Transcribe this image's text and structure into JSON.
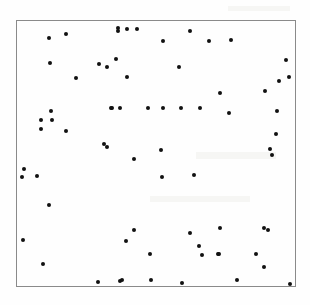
{
  "figure": {
    "title": "",
    "width": 310,
    "height": 305,
    "background_color": "#fefefe",
    "frame": {
      "x": 16,
      "y": 20,
      "width": 280,
      "height": 267,
      "border_color": "#8a8a8a",
      "border_width": 1
    },
    "marker": {
      "color": "#111111",
      "size_px": 4,
      "shape": "circle"
    }
  },
  "chart_data": {
    "type": "scatter",
    "title": "",
    "xlabel": "",
    "ylabel": "",
    "xlim": [
      0,
      1
    ],
    "ylim": [
      0,
      1
    ],
    "grid": false,
    "legend": null,
    "tick_labels": {
      "x": [],
      "y": []
    },
    "n_points": 71,
    "series": [
      {
        "name": "points",
        "color": "#111111",
        "marker": "circle",
        "points_px": [
          [
            47.7,
            37.0
          ],
          [
            65.0,
            33.0
          ],
          [
            117.3,
            26.7
          ],
          [
            117.3,
            29.7
          ],
          [
            126.0,
            28.0
          ],
          [
            136.0,
            28.0
          ],
          [
            188.7,
            29.7
          ],
          [
            208.3,
            40.0
          ],
          [
            230.0,
            39.0
          ],
          [
            162.0,
            40.0
          ],
          [
            49.0,
            61.7
          ],
          [
            98.0,
            63.3
          ],
          [
            105.7,
            66.3
          ],
          [
            114.7,
            58.3
          ],
          [
            177.7,
            65.7
          ],
          [
            285.0,
            58.7
          ],
          [
            75.3,
            77.3
          ],
          [
            126.3,
            76.3
          ],
          [
            288.3,
            76.3
          ],
          [
            277.7,
            80.0
          ],
          [
            264.0,
            90.3
          ],
          [
            218.7,
            92.0
          ],
          [
            110.0,
            107.0
          ],
          [
            110.7,
            107.0
          ],
          [
            119.0,
            107.0
          ],
          [
            146.7,
            107.0
          ],
          [
            162.3,
            107.0
          ],
          [
            180.0,
            107.0
          ],
          [
            199.0,
            107.0
          ],
          [
            227.7,
            111.7
          ],
          [
            49.7,
            110.3
          ],
          [
            39.7,
            118.7
          ],
          [
            50.7,
            119.0
          ],
          [
            40.0,
            128.3
          ],
          [
            65.0,
            130.0
          ],
          [
            275.0,
            133.0
          ],
          [
            102.7,
            142.7
          ],
          [
            106.0,
            145.7
          ],
          [
            133.3,
            157.7
          ],
          [
            160.3,
            149.0
          ],
          [
            271.0,
            154.0
          ],
          [
            160.7,
            176.3
          ],
          [
            192.7,
            174.0
          ],
          [
            23.3,
            168.3
          ],
          [
            21.3,
            176.0
          ],
          [
            36.3,
            175.3
          ],
          [
            47.7,
            204.0
          ],
          [
            22.3,
            239.0
          ],
          [
            41.7,
            263.0
          ],
          [
            97.3,
            281.0
          ],
          [
            119.0,
            280.0
          ],
          [
            132.7,
            229.0
          ],
          [
            125.0,
            239.7
          ],
          [
            149.3,
            253.0
          ],
          [
            188.7,
            232.0
          ],
          [
            198.0,
            244.7
          ],
          [
            201.0,
            254.3
          ],
          [
            217.0,
            252.7
          ],
          [
            218.7,
            227.0
          ],
          [
            263.0,
            227.0
          ],
          [
            218.0,
            253.3
          ],
          [
            255.0,
            253.3
          ],
          [
            263.3,
            266.0
          ],
          [
            235.7,
            279.0
          ],
          [
            289.0,
            282.7
          ],
          [
            121.0,
            279.0
          ],
          [
            149.7,
            278.7
          ],
          [
            180.7,
            282.3
          ],
          [
            267.0,
            229.0
          ],
          [
            269.0,
            148.0
          ],
          [
            276.0,
            110.0
          ]
        ]
      }
    ]
  }
}
